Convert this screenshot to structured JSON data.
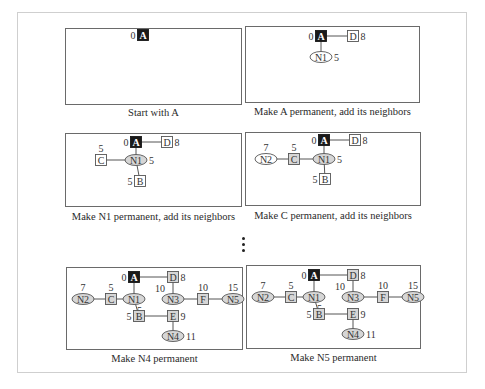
{
  "figure": {
    "colors": {
      "source_fill": "#1a1a1a",
      "permanent_fill": "#d6d6d6",
      "tentative_fill": "#ffffff",
      "stroke": "#555555"
    },
    "continuation_marker": "⋮",
    "panels": [
      {
        "caption": "Start with A",
        "nodes": [
          {
            "id": "A",
            "shape": "square",
            "state": "source",
            "x": 77,
            "y": 6,
            "dist": "0",
            "dist_pos": "left"
          }
        ],
        "edges": []
      },
      {
        "caption": "Make A permanent, add its neighbors",
        "nodes": [
          {
            "id": "A",
            "shape": "square",
            "state": "source",
            "x": 75,
            "y": 9,
            "dist": "0",
            "dist_pos": "left"
          },
          {
            "id": "D",
            "shape": "square",
            "state": "tentative",
            "x": 107,
            "y": 9,
            "dist": "8",
            "dist_pos": "right"
          },
          {
            "id": "N1",
            "shape": "ellipse",
            "state": "tentative",
            "x": 75,
            "y": 30,
            "dist": "5",
            "dist_pos": "right"
          }
        ],
        "edges": [
          [
            "A",
            "D"
          ],
          [
            "A",
            "N1"
          ]
        ]
      },
      {
        "caption": "Make N1 permanent, add its neighbors",
        "nodes": [
          {
            "id": "A",
            "shape": "square",
            "state": "source",
            "x": 70,
            "y": 8,
            "dist": "0",
            "dist_pos": "left"
          },
          {
            "id": "D",
            "shape": "square",
            "state": "tentative",
            "x": 101,
            "y": 8,
            "dist": "8",
            "dist_pos": "right"
          },
          {
            "id": "N1",
            "shape": "ellipse",
            "state": "permanent",
            "x": 70,
            "y": 26,
            "dist": "5",
            "dist_pos": "right"
          },
          {
            "id": "C",
            "shape": "square",
            "state": "tentative",
            "x": 35,
            "y": 26,
            "dist": "5",
            "dist_pos": "top"
          },
          {
            "id": "B",
            "shape": "square",
            "state": "tentative",
            "x": 74,
            "y": 47,
            "dist": "5",
            "dist_pos": "left"
          }
        ],
        "edges": [
          [
            "A",
            "D"
          ],
          [
            "A",
            "N1"
          ],
          [
            "N1",
            "C"
          ],
          [
            "N1",
            "B"
          ]
        ]
      },
      {
        "caption": "Make C permanent, add its neighbors",
        "nodes": [
          {
            "id": "A",
            "shape": "square",
            "state": "source",
            "x": 78,
            "y": 7,
            "dist": "0",
            "dist_pos": "left"
          },
          {
            "id": "D",
            "shape": "square",
            "state": "tentative",
            "x": 109,
            "y": 7,
            "dist": "8",
            "dist_pos": "right"
          },
          {
            "id": "N1",
            "shape": "ellipse",
            "state": "permanent",
            "x": 78,
            "y": 26,
            "dist": "5",
            "dist_pos": "right"
          },
          {
            "id": "C",
            "shape": "square",
            "state": "permanent",
            "x": 48,
            "y": 26,
            "dist": "5",
            "dist_pos": "top"
          },
          {
            "id": "N2",
            "shape": "ellipse",
            "state": "tentative",
            "x": 20,
            "y": 26,
            "dist": "7",
            "dist_pos": "top"
          },
          {
            "id": "B",
            "shape": "square",
            "state": "tentative",
            "x": 79,
            "y": 46,
            "dist": "5",
            "dist_pos": "left"
          }
        ],
        "edges": [
          [
            "A",
            "D"
          ],
          [
            "A",
            "N1"
          ],
          [
            "N1",
            "C"
          ],
          [
            "C",
            "N2"
          ],
          [
            "N1",
            "B"
          ]
        ]
      },
      {
        "caption": "Make N4 permanent",
        "nodes": [
          {
            "id": "A",
            "shape": "square",
            "state": "source",
            "x": 67,
            "y": 9,
            "dist": "0",
            "dist_pos": "left"
          },
          {
            "id": "D",
            "shape": "square",
            "state": "permanent",
            "x": 106,
            "y": 9,
            "dist": "8",
            "dist_pos": "right"
          },
          {
            "id": "N1",
            "shape": "ellipse",
            "state": "permanent",
            "x": 67,
            "y": 31,
            "dist": "5",
            "dist_pos": "bottomright"
          },
          {
            "id": "C",
            "shape": "square",
            "state": "permanent",
            "x": 44,
            "y": 31,
            "dist": "5",
            "dist_pos": "top"
          },
          {
            "id": "N2",
            "shape": "ellipse",
            "state": "permanent",
            "x": 16,
            "y": 31,
            "dist": "7",
            "dist_pos": "top"
          },
          {
            "id": "N3",
            "shape": "ellipse",
            "state": "permanent",
            "x": 106,
            "y": 31,
            "dist": "10",
            "dist_pos": "topleft"
          },
          {
            "id": "F",
            "shape": "square",
            "state": "permanent",
            "x": 136,
            "y": 31,
            "dist": "10",
            "dist_pos": "top"
          },
          {
            "id": "N5",
            "shape": "ellipse",
            "state": "permanent",
            "x": 166,
            "y": 31,
            "dist": "15",
            "dist_pos": "top"
          },
          {
            "id": "B",
            "shape": "square",
            "state": "permanent",
            "x": 72,
            "y": 48,
            "dist": "5",
            "dist_pos": "left"
          },
          {
            "id": "E",
            "shape": "square",
            "state": "permanent",
            "x": 106,
            "y": 48,
            "dist": "9",
            "dist_pos": "right"
          },
          {
            "id": "N4",
            "shape": "ellipse",
            "state": "permanent",
            "x": 106,
            "y": 68,
            "dist": "11",
            "dist_pos": "right"
          }
        ],
        "edges": [
          [
            "A",
            "D"
          ],
          [
            "A",
            "N1"
          ],
          [
            "N1",
            "C"
          ],
          [
            "C",
            "N2"
          ],
          [
            "D",
            "N3"
          ],
          [
            "N3",
            "F"
          ],
          [
            "F",
            "N5"
          ],
          [
            "N1",
            "B"
          ],
          [
            "B",
            "E"
          ],
          [
            "E",
            "N4"
          ]
        ]
      },
      {
        "caption": "Make N5 permanent",
        "nodes": [
          {
            "id": "A",
            "shape": "square",
            "state": "source",
            "x": 67,
            "y": 9,
            "dist": "0",
            "dist_pos": "left"
          },
          {
            "id": "D",
            "shape": "square",
            "state": "permanent",
            "x": 106,
            "y": 9,
            "dist": "8",
            "dist_pos": "right"
          },
          {
            "id": "N1",
            "shape": "ellipse",
            "state": "permanent",
            "x": 67,
            "y": 31,
            "dist": "5",
            "dist_pos": "bottomright"
          },
          {
            "id": "C",
            "shape": "square",
            "state": "permanent",
            "x": 44,
            "y": 31,
            "dist": "5",
            "dist_pos": "top"
          },
          {
            "id": "N2",
            "shape": "ellipse",
            "state": "permanent",
            "x": 16,
            "y": 31,
            "dist": "7",
            "dist_pos": "top"
          },
          {
            "id": "N3",
            "shape": "ellipse",
            "state": "permanent",
            "x": 106,
            "y": 31,
            "dist": "10",
            "dist_pos": "topleft"
          },
          {
            "id": "F",
            "shape": "square",
            "state": "permanent",
            "x": 136,
            "y": 31,
            "dist": "10",
            "dist_pos": "top"
          },
          {
            "id": "N5",
            "shape": "ellipse",
            "state": "permanent",
            "x": 166,
            "y": 31,
            "dist": "15",
            "dist_pos": "top"
          },
          {
            "id": "B",
            "shape": "square",
            "state": "permanent",
            "x": 72,
            "y": 48,
            "dist": "5",
            "dist_pos": "left"
          },
          {
            "id": "E",
            "shape": "square",
            "state": "permanent",
            "x": 106,
            "y": 48,
            "dist": "9",
            "dist_pos": "right"
          },
          {
            "id": "N4",
            "shape": "ellipse",
            "state": "permanent",
            "x": 106,
            "y": 68,
            "dist": "11",
            "dist_pos": "right"
          }
        ],
        "edges": [
          [
            "A",
            "D"
          ],
          [
            "A",
            "N1"
          ],
          [
            "N1",
            "C"
          ],
          [
            "C",
            "N2"
          ],
          [
            "D",
            "N3"
          ],
          [
            "N3",
            "F"
          ],
          [
            "F",
            "N5"
          ],
          [
            "N1",
            "B"
          ],
          [
            "B",
            "E"
          ],
          [
            "E",
            "N4"
          ]
        ]
      }
    ]
  }
}
